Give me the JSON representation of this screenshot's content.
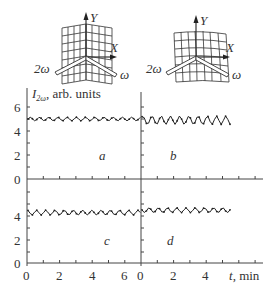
{
  "diagrams": [
    {
      "id": "left",
      "y_label": "Y",
      "x_label": "X",
      "beam_out": "2ω",
      "beam_in": "ω",
      "surface": "folded (V-shaped) grid"
    },
    {
      "id": "right",
      "y_label": "Y",
      "x_label": "X",
      "beam_out": "2ω",
      "beam_in": "ω",
      "surface": "tilted wavy grid"
    }
  ],
  "y_axis_title": "I",
  "y_axis_sub": "2ω",
  "y_axis_suffix": ", arb. units",
  "x_axis_title": "t, min",
  "chart_data": [
    {
      "panel": "a",
      "type": "line",
      "title": "a",
      "xlabel": "t, min",
      "ylabel": "I2ω, arb. units",
      "xlim": [
        0,
        7
      ],
      "ylim": [
        0,
        6.5
      ],
      "xticks": [
        0,
        2,
        4,
        6
      ],
      "yticks": [
        0,
        2,
        4,
        6
      ],
      "grid": false,
      "series": [
        {
          "name": "I2ω",
          "mean": 5.0,
          "oscillation_amplitude": 0.15,
          "x_range": [
            0,
            7
          ]
        }
      ]
    },
    {
      "panel": "b",
      "type": "line",
      "title": "b",
      "xlabel": "t, min",
      "ylabel": "I2ω, arb. units",
      "xlim": [
        0,
        7
      ],
      "ylim": [
        0,
        6.5
      ],
      "xticks": [
        0,
        2,
        4,
        6
      ],
      "yticks": [
        0,
        2,
        4,
        6
      ],
      "grid": false,
      "series": [
        {
          "name": "I2ω",
          "mean": 4.9,
          "oscillation_amplitude": 0.35,
          "x_range": [
            0,
            5.5
          ]
        }
      ]
    },
    {
      "panel": "c",
      "type": "line",
      "title": "c",
      "xlabel": "t, min",
      "ylabel": "I2ω, arb. units",
      "xlim": [
        0,
        7
      ],
      "ylim": [
        0,
        7
      ],
      "xticks": [
        0,
        2,
        4,
        6
      ],
      "yticks": [
        0,
        2,
        4,
        6
      ],
      "grid": false,
      "series": [
        {
          "name": "I2ω",
          "mean": 4.2,
          "oscillation_amplitude": 0.2,
          "x_range": [
            0,
            7
          ]
        }
      ]
    },
    {
      "panel": "d",
      "type": "line",
      "title": "d",
      "xlabel": "t, min",
      "ylabel": "I2ω, arb. units",
      "xlim": [
        0,
        7
      ],
      "ylim": [
        0,
        7
      ],
      "xticks": [
        0,
        2,
        4
      ],
      "yticks": [
        0,
        2,
        4,
        6
      ],
      "grid": false,
      "series": [
        {
          "name": "I2ω",
          "mean": 4.4,
          "oscillation_amplitude": 0.2,
          "x_range": [
            0,
            5.5
          ]
        }
      ]
    }
  ],
  "ticks": {
    "y": [
      "0",
      "2",
      "4",
      "6"
    ],
    "x_left": [
      "0",
      "2",
      "4",
      "6"
    ],
    "x_right": [
      "0",
      "2",
      "4"
    ]
  },
  "panel_labels": [
    "a",
    "b",
    "c",
    "d"
  ]
}
